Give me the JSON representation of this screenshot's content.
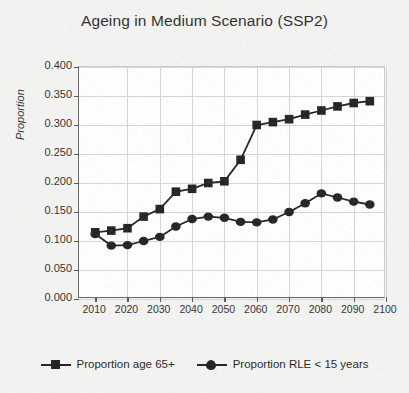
{
  "chart_data": {
    "type": "line",
    "title": "Ageing in Medium Scenario (SSP2)",
    "xlabel": "",
    "ylabel": "Proportion",
    "xlim": [
      2005,
      2100
    ],
    "ylim": [
      0.0,
      0.4
    ],
    "grid": true,
    "legend_position": "bottom",
    "x": [
      2010,
      2015,
      2020,
      2025,
      2030,
      2035,
      2040,
      2045,
      2050,
      2055,
      2060,
      2065,
      2070,
      2075,
      2080,
      2085,
      2090,
      2095
    ],
    "xtick_labels": [
      "2010",
      "2020",
      "2030",
      "2040",
      "2050",
      "2060",
      "2070",
      "2080",
      "2090",
      "2100"
    ],
    "xticks": [
      2010,
      2020,
      2030,
      2040,
      2050,
      2060,
      2070,
      2080,
      2090,
      2100
    ],
    "ytick_labels": [
      "0.400",
      "0.350",
      "0.300",
      "0.250",
      "0.200",
      "0.150",
      "0.100",
      "0.050",
      "0.000"
    ],
    "yticks": [
      0.4,
      0.35,
      0.3,
      0.25,
      0.2,
      0.15,
      0.1,
      0.05,
      0.0
    ],
    "series": [
      {
        "name": "Proportion age 65+",
        "marker": "square",
        "color": "#111111",
        "values": [
          0.115,
          0.118,
          0.122,
          0.142,
          0.155,
          0.185,
          0.19,
          0.2,
          0.203,
          0.24,
          0.3,
          0.305,
          0.31,
          0.318,
          0.325,
          0.332,
          0.338,
          0.341
        ]
      },
      {
        "name": "Proportion RLE < 15 years",
        "marker": "diamond",
        "color": "#111111",
        "values": [
          0.112,
          0.092,
          0.093,
          0.1,
          0.107,
          0.125,
          0.138,
          0.142,
          0.14,
          0.133,
          0.132,
          0.137,
          0.15,
          0.165,
          0.182,
          0.175,
          0.168,
          0.163
        ]
      }
    ]
  },
  "legend": {
    "entries": [
      {
        "label": "Proportion age 65+"
      },
      {
        "label": "Proportion RLE < 15 years"
      }
    ]
  }
}
